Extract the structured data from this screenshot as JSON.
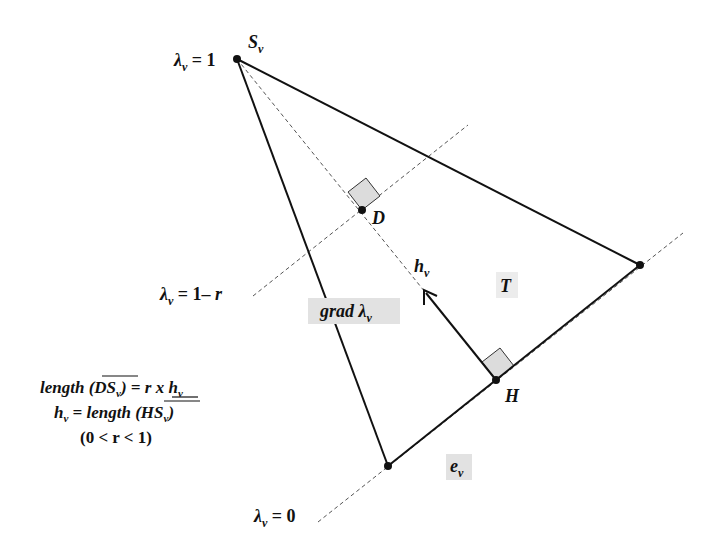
{
  "diagram": {
    "colors": {
      "stroke": "#111111",
      "highlight": "#dcdcdc",
      "dash": "#555555"
    },
    "labels": {
      "vertex_s": "S",
      "vertex_s_sub": "v",
      "lambda_1": "λ",
      "lambda_1_sub": "v",
      "lambda_1_rhs": " = 1",
      "lambda_1r": "λ",
      "lambda_1r_sub": "v",
      "lambda_1r_rhs": " = 1– ",
      "lambda_1r_r": "r",
      "lambda_0": "λ",
      "lambda_0_sub": "v",
      "lambda_0_rhs": " = 0",
      "point_d": "D",
      "point_h": "H",
      "h_v": "h",
      "h_v_sub": "v",
      "triangle": "T",
      "grad": "grad λ",
      "grad_sub": "v",
      "edge": "e",
      "edge_sub": "v"
    },
    "formulas": {
      "line1_a": "length (",
      "line1_b": "DS",
      "line1_sub": "v",
      "line1_c": ") = ",
      "line1_d": "r x",
      "line1_e": " h",
      "line1_sub2": "v",
      "line2_a": "h",
      "line2_sub": "v",
      "line2_b": " = length (",
      "line2_c": "HS",
      "line2_sub2": "v",
      "line2_d": ")",
      "line3": "(0 < r < 1)"
    }
  }
}
